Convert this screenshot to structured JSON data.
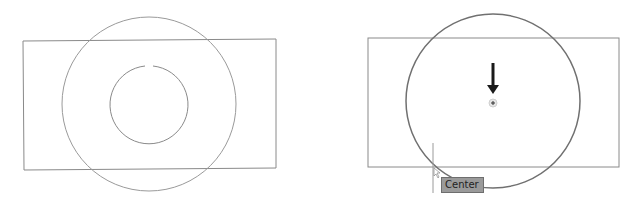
{
  "panels": [
    {
      "id": "left",
      "description": "Rectangle with two concentric circles (before)",
      "rect": {
        "x": 23,
        "y": 41,
        "w": 253,
        "h": 129
      },
      "outer_circle": {
        "cx": 149,
        "cy": 104,
        "r": 87
      },
      "inner_circle": {
        "cx": 149,
        "cy": 105,
        "r": 39,
        "gap_at_top": true
      }
    },
    {
      "id": "right",
      "description": "Rectangle with circle and center snap marker (after)",
      "rect": {
        "x": 368,
        "y": 38,
        "w": 251,
        "h": 129
      },
      "circle": {
        "cx": 493,
        "cy": 101,
        "r": 87
      },
      "arrow": {
        "x": 493,
        "y1": 63,
        "y2": 94
      },
      "center_marker": {
        "cx": 493,
        "cy": 103
      },
      "cursor_line": {
        "x": 433,
        "y1": 143,
        "y2": 193
      },
      "tooltip": {
        "label": "Center"
      }
    }
  ],
  "colors": {
    "line": "#8a8a8a",
    "line_dark": "#707070",
    "arrow": "#1a1a1a",
    "tooltip_bg": "#9a9a9a"
  }
}
